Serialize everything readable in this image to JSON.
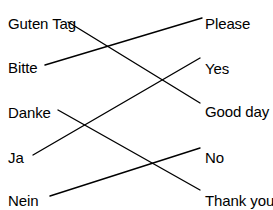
{
  "exercise": {
    "title": "German to English matching exercise",
    "background_color": "#ffffff",
    "text_color": "#000000",
    "line_color": "#000000"
  },
  "left_column": {
    "name": "german-terms",
    "items": [
      {
        "id": "guten-tag",
        "label": "Guten Tag",
        "x": 8,
        "y": 16,
        "anchor_x": 68,
        "anchor_y": 22
      },
      {
        "id": "bitte",
        "label": "Bitte",
        "x": 8,
        "y": 60,
        "anchor_x": 45,
        "anchor_y": 65
      },
      {
        "id": "danke",
        "label": "Danke",
        "x": 8,
        "y": 105,
        "anchor_x": 58,
        "anchor_y": 110
      },
      {
        "id": "ja",
        "label": "Ja",
        "x": 8,
        "y": 150,
        "anchor_x": 33,
        "anchor_y": 155
      },
      {
        "id": "nein",
        "label": "Nein",
        "x": 8,
        "y": 193,
        "anchor_x": 50,
        "anchor_y": 196
      }
    ]
  },
  "right_column": {
    "name": "english-terms",
    "items": [
      {
        "id": "please",
        "label": "Please",
        "x": 205,
        "y": 16,
        "anchor_x": 202,
        "anchor_y": 18
      },
      {
        "id": "yes",
        "label": "Yes",
        "x": 205,
        "y": 61,
        "anchor_x": 200,
        "anchor_y": 58
      },
      {
        "id": "good-day",
        "label": "Good day",
        "x": 205,
        "y": 104,
        "anchor_x": 200,
        "anchor_y": 103
      },
      {
        "id": "no",
        "label": "No",
        "x": 205,
        "y": 150,
        "anchor_x": 200,
        "anchor_y": 148
      },
      {
        "id": "thank-you",
        "label": "Thank you",
        "x": 205,
        "y": 193,
        "anchor_x": 200,
        "anchor_y": 190
      }
    ]
  },
  "connections": [
    {
      "id": "guten-tag-to-good-day",
      "from": "guten-tag",
      "to": "good-day",
      "x1": 68,
      "y1": 22,
      "x2": 200,
      "y2": 103
    },
    {
      "id": "bitte-to-please",
      "from": "bitte",
      "to": "please",
      "x1": 45,
      "y1": 65,
      "x2": 202,
      "y2": 18
    },
    {
      "id": "danke-to-thank-you",
      "from": "danke",
      "to": "thank-you",
      "x1": 58,
      "y1": 110,
      "x2": 200,
      "y2": 190
    },
    {
      "id": "ja-to-yes",
      "from": "ja",
      "to": "yes",
      "x1": 33,
      "y1": 155,
      "x2": 200,
      "y2": 58
    },
    {
      "id": "nein-to-no",
      "from": "nein",
      "to": "no",
      "x1": 50,
      "y1": 196,
      "x2": 200,
      "y2": 148
    }
  ]
}
